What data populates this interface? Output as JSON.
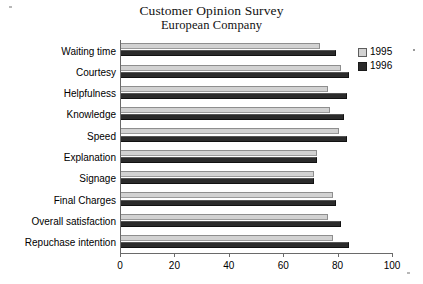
{
  "chart_data": {
    "type": "bar",
    "orientation": "horizontal",
    "title": "Customer Opinion Survey",
    "subtitle": "European Company",
    "xlabel": "",
    "ylabel": "",
    "xlim": [
      0,
      100
    ],
    "xticks": [
      0,
      20,
      40,
      60,
      80,
      100
    ],
    "xtick_labels": [
      "0",
      "20",
      "40",
      "60",
      "80",
      "100"
    ],
    "grid": false,
    "legend_position": "right",
    "categories": [
      "Waiting time",
      "Courtesy",
      "Helpfulness",
      "Knowledge",
      "Speed",
      "Explanation",
      "Signage",
      "Final Charges",
      "Overall satisfaction",
      "Repuchase intention"
    ],
    "series": [
      {
        "name": "1995",
        "color": "#d2d2d2",
        "values": [
          73,
          81,
          76,
          77,
          80,
          72,
          71,
          78,
          76,
          78
        ]
      },
      {
        "name": "1996",
        "color": "#2b2b2b",
        "values": [
          79,
          84,
          83,
          82,
          83,
          72,
          71,
          79,
          81,
          84
        ]
      }
    ]
  },
  "legend": {
    "entries": [
      {
        "label": "1995",
        "swatch": "light-gray-square"
      },
      {
        "label": "1996",
        "swatch": "dark-square"
      }
    ]
  }
}
